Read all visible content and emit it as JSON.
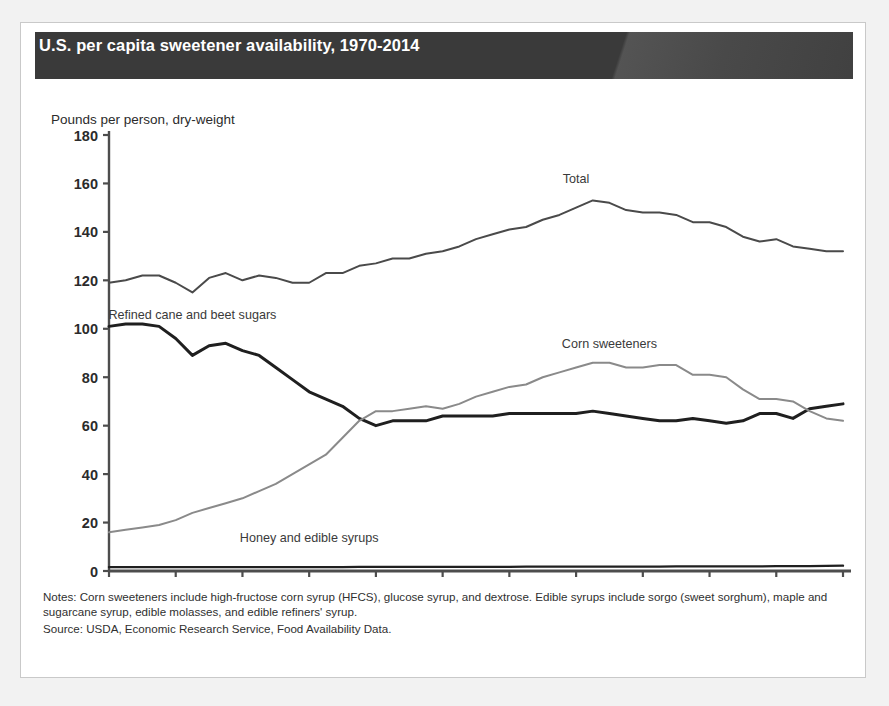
{
  "card": {
    "title": "U.S. per capita sweetener availability, 1970-2014",
    "axis_title": "Pounds per person, dry-weight",
    "notes": "Notes: Corn sweeteners include high-fructose corn syrup (HFCS), glucose syrup, and dextrose. Edible syrups include sorgo (sweet sorghum), maple and sugarcane syrup, edible molasses, and edible refiners' syrup.",
    "source": "Source: USDA, Economic Research Service, Food Availability Data.",
    "banner_color": "#3a3a3a"
  },
  "chart_data": {
    "type": "line",
    "title": "U.S. per capita sweetener availability, 1970-2014",
    "xlabel": "",
    "ylabel": "Pounds per person, dry-weight",
    "xlim": [
      1970,
      2014
    ],
    "ylim": [
      0,
      180
    ],
    "ytick_labels": [
      "0",
      "20",
      "40",
      "60",
      "80",
      "100",
      "120",
      "140",
      "160",
      "180"
    ],
    "yticks": [
      0,
      20,
      40,
      60,
      80,
      100,
      120,
      140,
      160,
      180
    ],
    "xtick_labels": [
      "1970",
      "1974",
      "1978",
      "1982",
      "1986",
      "1990",
      "1994",
      "1998",
      "2002",
      "2006",
      "2010",
      "2014"
    ],
    "xticks": [
      1970,
      1974,
      1978,
      1982,
      1986,
      1990,
      1994,
      1998,
      2002,
      2006,
      2010,
      2014
    ],
    "grid": false,
    "legend": "inline-annotations",
    "x": [
      1970,
      1971,
      1972,
      1973,
      1974,
      1975,
      1976,
      1977,
      1978,
      1979,
      1980,
      1981,
      1982,
      1983,
      1984,
      1985,
      1986,
      1987,
      1988,
      1989,
      1990,
      1991,
      1992,
      1993,
      1994,
      1995,
      1996,
      1997,
      1998,
      1999,
      2000,
      2001,
      2002,
      2003,
      2004,
      2005,
      2006,
      2007,
      2008,
      2009,
      2010,
      2011,
      2012,
      2013,
      2014
    ],
    "series": [
      {
        "name": "Total",
        "label": "Total",
        "color": "#4a4a4a",
        "width": 2.0,
        "label_x": 1998,
        "label_y": 160,
        "values": [
          119,
          120,
          122,
          122,
          119,
          115,
          121,
          123,
          120,
          122,
          121,
          119,
          119,
          123,
          123,
          126,
          127,
          129,
          129,
          131,
          132,
          134,
          137,
          139,
          141,
          142,
          145,
          147,
          150,
          153,
          152,
          149,
          148,
          148,
          147,
          144,
          144,
          142,
          138,
          136,
          137,
          134,
          133,
          132,
          132
        ]
      },
      {
        "name": "Refined cane and beet sugars",
        "label": "Refined cane and beet sugars",
        "color": "#1f1f1f",
        "width": 3.0,
        "label_x": 1975,
        "label_y": 104,
        "values": [
          101,
          102,
          102,
          101,
          96,
          89,
          93,
          94,
          91,
          89,
          84,
          79,
          74,
          71,
          68,
          63,
          60,
          62,
          62,
          62,
          64,
          64,
          64,
          64,
          65,
          65,
          65,
          65,
          65,
          66,
          65,
          64,
          63,
          62,
          62,
          63,
          62,
          61,
          62,
          65,
          65,
          63,
          67,
          68,
          69
        ]
      },
      {
        "name": "Corn sweeteners",
        "label": "Corn sweeteners",
        "color": "#8a8a8a",
        "width": 2.0,
        "label_x": 2000,
        "label_y": 92,
        "values": [
          16,
          17,
          18,
          19,
          21,
          24,
          26,
          28,
          30,
          33,
          36,
          40,
          44,
          48,
          55,
          62,
          66,
          66,
          67,
          68,
          67,
          69,
          72,
          74,
          76,
          77,
          80,
          82,
          84,
          86,
          86,
          84,
          84,
          85,
          85,
          81,
          81,
          80,
          75,
          71,
          71,
          70,
          66,
          63,
          62
        ]
      },
      {
        "name": "Honey and edible syrups",
        "label": "Honey and edible syrups",
        "color": "#1f1f1f",
        "width": 2.4,
        "label_x": 1982,
        "label_y": 12,
        "values": [
          1.6,
          1.6,
          1.6,
          1.6,
          1.6,
          1.6,
          1.6,
          1.6,
          1.6,
          1.6,
          1.6,
          1.6,
          1.6,
          1.6,
          1.6,
          1.7,
          1.7,
          1.7,
          1.7,
          1.7,
          1.7,
          1.7,
          1.7,
          1.7,
          1.7,
          1.8,
          1.8,
          1.8,
          1.8,
          1.8,
          1.8,
          1.8,
          1.8,
          1.8,
          1.9,
          1.9,
          1.9,
          1.9,
          1.9,
          1.9,
          2.0,
          2.0,
          2.0,
          2.1,
          2.2
        ]
      }
    ]
  }
}
